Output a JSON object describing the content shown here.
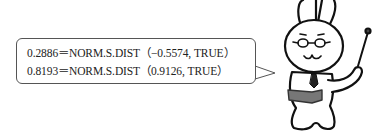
{
  "speech_bubble": {
    "lines": [
      "0.2886＝NORM.S.DIST（−0.5574, TRUE）",
      "0.8193＝NORM.S.DIST（0.9126, TRUE）"
    ]
  },
  "character": {
    "name": "rabbit-teacher",
    "accessories": [
      "glasses-icon",
      "pointer-stick-icon",
      "open-book-icon",
      "necktie-icon"
    ]
  }
}
